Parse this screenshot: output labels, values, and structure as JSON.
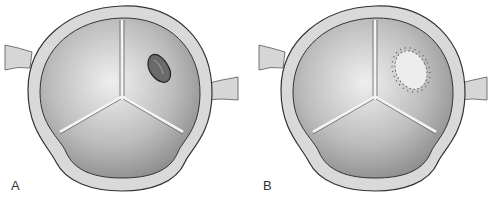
{
  "figure": {
    "panels": [
      {
        "label": "A",
        "subject": "aortic-valve",
        "finding": "leaflet lesion / perforation"
      },
      {
        "label": "B",
        "subject": "aortic-valve",
        "finding": "patch repair sutured over defect"
      }
    ]
  },
  "colors": {
    "ring_fill": "#d8d8d8",
    "ring_stroke": "#333333",
    "leaflet_fill": "#bdbdbd",
    "commissure": "#f2f2f2",
    "lesion": "#4a4a4a",
    "patch": "#e6e6e6",
    "suture": "#555555"
  }
}
